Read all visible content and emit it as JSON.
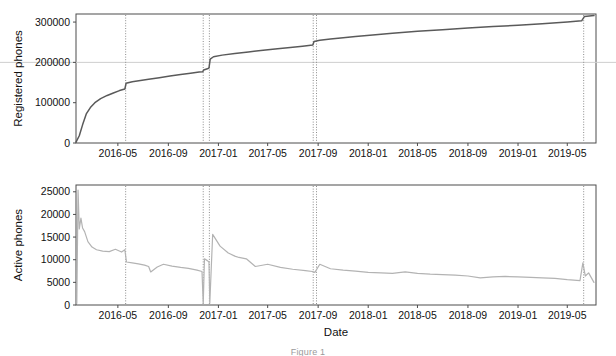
{
  "figure": {
    "caption": "Figure 1",
    "background": "#ffffff",
    "panel_border_color": "#4d4d4d",
    "gridline_color": "#cfcfcf",
    "event_line_color": "#8c8c8c"
  },
  "chart_data": [
    {
      "type": "line",
      "id": "registered-phones",
      "title": "",
      "xlabel": "",
      "ylabel": "Registered phones",
      "ylim": [
        0,
        320000
      ],
      "xlim": [
        "2016-01-20",
        "2019-07-10"
      ],
      "grid": true,
      "gridlines_y": [
        200000
      ],
      "legend": "none",
      "yticks": [
        0,
        100000,
        200000,
        300000
      ],
      "ytick_labels": [
        "0",
        "100000",
        "200000",
        "300000"
      ],
      "xticks": [
        "2016-05",
        "2016-09",
        "2017-01",
        "2017-05",
        "2017-09",
        "2018-01",
        "2018-05",
        "2018-09",
        "2019-01",
        "2019-05"
      ],
      "xtick_labels": [
        "2016-05",
        "2016-09",
        "2017-01",
        "2017-05",
        "2017-09",
        "2018-01",
        "2018-05",
        "2018-09",
        "2019-01",
        "2019-05"
      ],
      "line_color": "#5a5a5a",
      "event_lines": [
        "2016-05-20",
        "2016-11-25",
        "2016-12-10",
        "2017-08-20",
        "2017-08-28",
        "2019-06-10"
      ],
      "series": [
        {
          "name": "Registered phones",
          "x": [
            "2016-01-20",
            "2016-01-28",
            "2016-02-05",
            "2016-02-14",
            "2016-02-24",
            "2016-03-06",
            "2016-03-20",
            "2016-04-05",
            "2016-04-20",
            "2016-05-05",
            "2016-05-18",
            "2016-05-21",
            "2016-06-05",
            "2016-06-25",
            "2016-07-15",
            "2016-08-10",
            "2016-09-05",
            "2016-10-01",
            "2016-10-25",
            "2016-11-15",
            "2016-11-24",
            "2016-11-26",
            "2016-12-05",
            "2016-12-09",
            "2016-12-12",
            "2016-12-20",
            "2017-01-10",
            "2017-02-10",
            "2017-03-15",
            "2017-04-20",
            "2017-05-25",
            "2017-06-25",
            "2017-07-25",
            "2017-08-19",
            "2017-08-22",
            "2017-09-05",
            "2017-10-01",
            "2017-11-01",
            "2017-12-01",
            "2018-01-05",
            "2018-03-01",
            "2018-05-01",
            "2018-07-01",
            "2018-09-01",
            "2018-11-01",
            "2019-01-01",
            "2019-03-01",
            "2019-05-01",
            "2019-06-05",
            "2019-06-12",
            "2019-07-05"
          ],
          "y": [
            2000,
            18000,
            45000,
            72000,
            88000,
            100000,
            110000,
            118000,
            124000,
            130000,
            134000,
            148000,
            152000,
            155000,
            158000,
            162000,
            166000,
            170000,
            173000,
            176000,
            177000,
            181000,
            184000,
            186000,
            208000,
            214000,
            218000,
            222000,
            226000,
            230000,
            234000,
            237000,
            240000,
            243000,
            252000,
            255000,
            258000,
            261000,
            264000,
            267000,
            272000,
            277000,
            281000,
            285000,
            289000,
            292000,
            296000,
            300000,
            303000,
            314000,
            316000
          ]
        }
      ]
    },
    {
      "type": "line",
      "id": "active-phones",
      "title": "",
      "xlabel": "Date",
      "ylabel": "Active phones",
      "ylim": [
        0,
        26500
      ],
      "xlim": [
        "2016-01-20",
        "2019-07-10"
      ],
      "grid": false,
      "legend": "none",
      "yticks": [
        0,
        5000,
        10000,
        15000,
        20000,
        25000
      ],
      "ytick_labels": [
        "0",
        "5000",
        "10000",
        "15000",
        "20000",
        "25000"
      ],
      "xticks": [
        "2016-05",
        "2016-09",
        "2017-01",
        "2017-05",
        "2017-09",
        "2018-01",
        "2018-05",
        "2018-09",
        "2019-01",
        "2019-05"
      ],
      "xtick_labels": [
        "2016-05",
        "2016-09",
        "2017-01",
        "2017-05",
        "2017-09",
        "2018-01",
        "2018-05",
        "2018-09",
        "2019-01",
        "2019-05"
      ],
      "line_color": "#b3b3b3",
      "event_lines": [
        "2016-05-20",
        "2016-11-25",
        "2016-12-10",
        "2017-08-20",
        "2017-08-28",
        "2019-06-10"
      ],
      "series": [
        {
          "name": "Active phones",
          "x": [
            "2016-01-22",
            "2016-01-25",
            "2016-01-28",
            "2016-02-01",
            "2016-02-05",
            "2016-02-10",
            "2016-02-18",
            "2016-02-28",
            "2016-03-10",
            "2016-03-25",
            "2016-04-10",
            "2016-04-25",
            "2016-05-10",
            "2016-05-18",
            "2016-05-22",
            "2016-06-05",
            "2016-06-20",
            "2016-07-05",
            "2016-07-15",
            "2016-07-20",
            "2016-08-05",
            "2016-08-20",
            "2016-09-10",
            "2016-10-01",
            "2016-10-20",
            "2016-11-10",
            "2016-11-22",
            "2016-11-25",
            "2016-11-28",
            "2016-12-05",
            "2016-12-09",
            "2016-12-11",
            "2016-12-18",
            "2017-01-05",
            "2017-01-25",
            "2017-02-10",
            "2017-02-20",
            "2017-03-10",
            "2017-04-01",
            "2017-05-01",
            "2017-06-01",
            "2017-07-01",
            "2017-08-01",
            "2017-08-18",
            "2017-08-24",
            "2017-09-05",
            "2017-10-01",
            "2017-11-01",
            "2017-12-01",
            "2018-01-01",
            "2018-02-01",
            "2018-03-01",
            "2018-04-01",
            "2018-05-01",
            "2018-06-01",
            "2018-07-01",
            "2018-08-01",
            "2018-09-01",
            "2018-10-01",
            "2018-11-01",
            "2018-12-01",
            "2019-01-01",
            "2019-02-01",
            "2019-03-01",
            "2019-04-01",
            "2019-05-01",
            "2019-06-01",
            "2019-06-08",
            "2019-06-14",
            "2019-06-22",
            "2019-07-05"
          ],
          "y": [
            400,
            25400,
            16800,
            19200,
            17000,
            16200,
            14000,
            12800,
            12200,
            11900,
            11800,
            12300,
            11700,
            12200,
            9500,
            9300,
            9100,
            8800,
            8500,
            7300,
            8400,
            9000,
            8600,
            8300,
            8100,
            7700,
            7400,
            300,
            10200,
            9800,
            9500,
            400,
            15600,
            13000,
            11500,
            10800,
            10500,
            10200,
            8500,
            9000,
            8300,
            7900,
            7600,
            7400,
            7200,
            9000,
            8000,
            7700,
            7500,
            7200,
            7100,
            7000,
            7300,
            7000,
            6800,
            6700,
            6600,
            6400,
            6000,
            6200,
            6300,
            6200,
            6100,
            6000,
            5900,
            5600,
            5400,
            9300,
            6400,
            7100,
            5000
          ]
        }
      ]
    }
  ]
}
